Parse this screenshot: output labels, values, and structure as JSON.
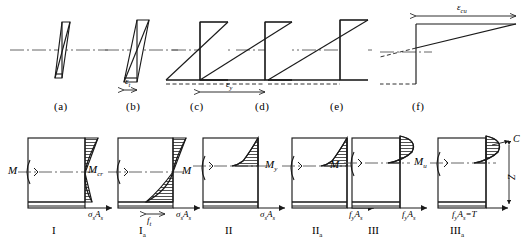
{
  "figure": {
    "kind": "reinforced-concrete-beam-strain-stress-stages",
    "top_row_caption_labels": [
      "(a)",
      "(b)",
      "(c)",
      "(d)",
      "(e)",
      "(f)"
    ],
    "bottom_row_stage_labels": [
      "I",
      "Ia",
      "II",
      "IIa",
      "III",
      "IIIa"
    ],
    "strain_annotations": {
      "b_strain": "εt",
      "d_strain": "εy",
      "f_strain": "εcu"
    },
    "moment_labels": {
      "panel1": "M",
      "panel2": "Mcr",
      "panel3": "M",
      "panel4": "My",
      "panel5": "M",
      "panel6": "Mu"
    },
    "stress_resultant_labels": {
      "panel1": "σsAs",
      "panel2": "σsAs",
      "panel2_tension": "ft",
      "panel3": "σsAs",
      "panel4": "fyAs",
      "panel5": "fyAs",
      "panel6": "fyAs=T"
    },
    "force_couple": {
      "compression": "C",
      "lever_arm": "Z",
      "tension": "T"
    }
  },
  "text": {
    "panel_a": "(a)",
    "panel_b": "(b)",
    "panel_c": "(c)",
    "panel_d": "(d)",
    "panel_e": "(e)",
    "panel_f": "(f)",
    "stage_1": "I",
    "stage_1a_main": "I",
    "stage_1a_sub": "a",
    "stage_2": "II",
    "stage_2a_main": "II",
    "stage_2a_sub": "a",
    "stage_3": "III",
    "stage_3a_main": "III",
    "stage_3a_sub": "a",
    "eps_t_main": "ε",
    "eps_t_sub": "t",
    "eps_y_main": "ε",
    "eps_y_sub": "y",
    "eps_cu_main": "ε",
    "eps_cu_sub": "cu",
    "M_plain": "M",
    "M_cr_main": "M",
    "M_cr_sub": "cr",
    "M_y_main": "M",
    "M_y_sub": "y",
    "M_u_main": "M",
    "M_u_sub": "u",
    "sigma_s": "σ",
    "sub_s": "s",
    "A_cap": "A",
    "f_t_main": "f",
    "f_t_sub": "t",
    "f_y_main": "f",
    "f_y_sub": "y",
    "eq_T": "=T",
    "force_C": "C",
    "force_Z": "Z"
  },
  "colors": {
    "ink": "#1a1a1a",
    "hatch": "#262626",
    "axis_dashdot": "#555555",
    "background": "#ffffff"
  }
}
